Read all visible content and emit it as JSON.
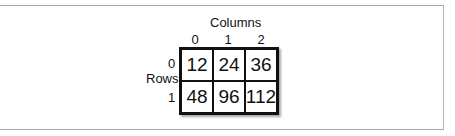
{
  "diagram": {
    "columns_label": "Columns",
    "rows_label": "Rows",
    "column_indices": [
      "0",
      "1",
      "2"
    ],
    "row_indices": [
      "0",
      "1"
    ],
    "cells": [
      [
        "12",
        "24",
        "36"
      ],
      [
        "48",
        "96",
        "112"
      ]
    ]
  }
}
